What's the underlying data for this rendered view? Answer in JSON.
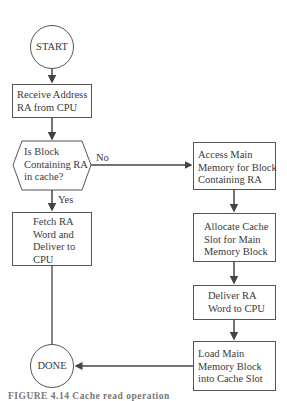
{
  "flowchart": {
    "start": {
      "label": "START"
    },
    "receive": {
      "lines": [
        "Receive Address",
        "RA from CPU"
      ]
    },
    "decision": {
      "lines": [
        "Is Block",
        "Containing RA",
        "in cache?"
      ]
    },
    "branch_no": {
      "label": "No"
    },
    "branch_yes": {
      "label": "Yes"
    },
    "fetch": {
      "lines": [
        "Fetch RA",
        "Word and",
        "Deliver to",
        "CPU"
      ]
    },
    "access": {
      "lines": [
        "Access Main",
        "Memory for Block",
        "Containing RA"
      ]
    },
    "allocate": {
      "lines": [
        "Allocate Cache",
        "Slot for Main",
        "Memory Block"
      ]
    },
    "deliver": {
      "lines": [
        "Deliver RA",
        "Word to CPU"
      ]
    },
    "load": {
      "lines": [
        "Load Main",
        "Memory Block",
        "into Cache Slot"
      ]
    },
    "done": {
      "label": "DONE"
    }
  },
  "caption": {
    "text": "FIGURE 4.14   Cache read operation"
  },
  "colors": {
    "stroke": "#555555",
    "text": "#3a3a3a",
    "background": "#ffffff"
  }
}
